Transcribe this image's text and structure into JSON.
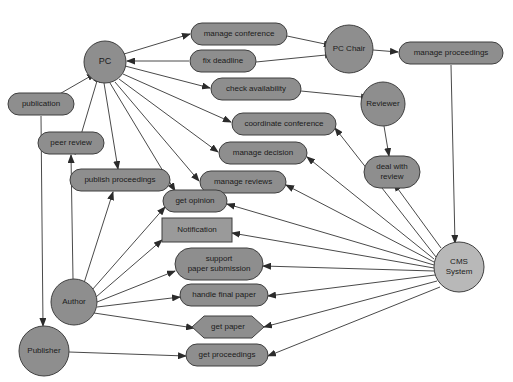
{
  "diagram": {
    "background": "#ffffff",
    "width": 513,
    "height": 382,
    "colors": {
      "actor_fill": "#8e8e8e",
      "usecase_fill": "#8e8e8e",
      "system_fill": "#b8b8b8",
      "rect_fill": "#9a9a9a",
      "hexagon_fill": "#8e8e8e",
      "stroke": "#3f3f3f",
      "edge": "#4a4a4a",
      "text": "#1b1b1b"
    },
    "nodes": [
      {
        "id": "pc",
        "label": "PC",
        "lines": [
          "PC"
        ],
        "shape": "circle",
        "cx": 105,
        "cy": 62,
        "rx": 21,
        "ry": 21,
        "fill": "#8e8e8e",
        "font_size": 9
      },
      {
        "id": "publication",
        "label": "publication",
        "lines": [
          "publication"
        ],
        "shape": "rounded",
        "cx": 41,
        "cy": 104,
        "rx": 33,
        "ry": 11,
        "fill": "#8e8e8e",
        "font_size": 8
      },
      {
        "id": "peer_review",
        "label": "peer review",
        "lines": [
          "peer review"
        ],
        "shape": "rounded",
        "cx": 71,
        "cy": 143,
        "rx": 33,
        "ry": 11,
        "fill": "#8e8e8e",
        "font_size": 8
      },
      {
        "id": "publish_proceedings",
        "label": "publish proceedings",
        "lines": [
          "publish proceedings"
        ],
        "shape": "rounded",
        "cx": 120,
        "cy": 180,
        "rx": 50,
        "ry": 11,
        "fill": "#8e8e8e",
        "font_size": 8
      },
      {
        "id": "manage_conference",
        "label": "manage conference",
        "lines": [
          "manage conference"
        ],
        "shape": "rounded",
        "cx": 239,
        "cy": 34,
        "rx": 48,
        "ry": 11,
        "fill": "#8e8e8e",
        "font_size": 8
      },
      {
        "id": "fix_deadline",
        "label": "fix deadline",
        "lines": [
          "fix deadline"
        ],
        "shape": "rounded",
        "cx": 223,
        "cy": 61,
        "rx": 33,
        "ry": 11,
        "fill": "#8e8e8e",
        "font_size": 8
      },
      {
        "id": "check_availability",
        "label": "check availability",
        "lines": [
          "check availability"
        ],
        "shape": "rounded",
        "cx": 256,
        "cy": 89,
        "rx": 45,
        "ry": 11,
        "fill": "#8e8e8e",
        "font_size": 8
      },
      {
        "id": "coordinate_conference",
        "label": "coordinate conference",
        "lines": [
          "coordinate conference"
        ],
        "shape": "rounded",
        "cx": 284,
        "cy": 124,
        "rx": 52,
        "ry": 11,
        "fill": "#8e8e8e",
        "font_size": 8
      },
      {
        "id": "manage_decision",
        "label": "manage decision",
        "lines": [
          "manage decision"
        ],
        "shape": "rounded",
        "cx": 263,
        "cy": 153,
        "rx": 44,
        "ry": 11,
        "fill": "#8e8e8e",
        "font_size": 8
      },
      {
        "id": "manage_reviews",
        "label": "manage reviews",
        "lines": [
          "manage reviews"
        ],
        "shape": "rounded",
        "cx": 243,
        "cy": 182,
        "rx": 43,
        "ry": 11,
        "fill": "#8e8e8e",
        "font_size": 8
      },
      {
        "id": "get_opinion",
        "label": "get opinion",
        "lines": [
          "get opinion"
        ],
        "shape": "rounded",
        "cx": 195,
        "cy": 201,
        "rx": 32,
        "ry": 11,
        "fill": "#8e8e8e",
        "font_size": 8
      },
      {
        "id": "notification",
        "label": "Notification",
        "lines": [
          "Notification"
        ],
        "shape": "rect",
        "cx": 197,
        "cy": 230,
        "rx": 35,
        "ry": 12,
        "fill": "#9a9a9a",
        "font_size": 8
      },
      {
        "id": "support_paper_submission",
        "label": "support paper submission",
        "lines": [
          "support",
          "paper submission"
        ],
        "shape": "rounded",
        "cx": 219,
        "cy": 264,
        "rx": 44,
        "ry": 16,
        "fill": "#8e8e8e",
        "font_size": 8
      },
      {
        "id": "handle_final_paper",
        "label": "handle final paper",
        "lines": [
          "handle final paper"
        ],
        "shape": "rounded",
        "cx": 224,
        "cy": 295,
        "rx": 44,
        "ry": 11,
        "fill": "#8e8e8e",
        "font_size": 8
      },
      {
        "id": "get_paper",
        "label": "get paper",
        "lines": [
          "get paper"
        ],
        "shape": "hexagon",
        "cx": 228,
        "cy": 327,
        "rx": 36,
        "ry": 11,
        "fill": "#8e8e8e",
        "font_size": 8
      },
      {
        "id": "get_proceedings",
        "label": "get proceedings",
        "lines": [
          "get proceedings"
        ],
        "shape": "rounded",
        "cx": 227,
        "cy": 355,
        "rx": 41,
        "ry": 11,
        "fill": "#8e8e8e",
        "font_size": 8
      },
      {
        "id": "pc_chair",
        "label": "PC Chair",
        "lines": [
          "PC Chair"
        ],
        "shape": "circle",
        "cx": 349,
        "cy": 49,
        "rx": 24,
        "ry": 24,
        "fill": "#8e8e8e",
        "font_size": 8
      },
      {
        "id": "manage_proceedings",
        "label": "manage proceedings",
        "lines": [
          "manage proceedings"
        ],
        "shape": "rounded",
        "cx": 451,
        "cy": 53,
        "rx": 52,
        "ry": 11,
        "fill": "#8e8e8e",
        "font_size": 8
      },
      {
        "id": "reviewer",
        "label": "Reviewer",
        "lines": [
          "Reviewer"
        ],
        "shape": "circle",
        "cx": 383,
        "cy": 104,
        "rx": 22,
        "ry": 22,
        "fill": "#8e8e8e",
        "font_size": 8
      },
      {
        "id": "deal_with_review",
        "label": "deal with review",
        "lines": [
          "deal with",
          "review"
        ],
        "shape": "rounded",
        "cx": 392,
        "cy": 172,
        "rx": 28,
        "ry": 16,
        "fill": "#8e8e8e",
        "font_size": 8
      },
      {
        "id": "cms_system",
        "label": "CMS System",
        "lines": [
          "CMS",
          "System"
        ],
        "shape": "circle",
        "cx": 459,
        "cy": 267,
        "rx": 25,
        "ry": 25,
        "fill": "#b8b8b8",
        "font_size": 8
      },
      {
        "id": "author",
        "label": "Author",
        "lines": [
          "Author"
        ],
        "shape": "circle",
        "cx": 74,
        "cy": 302,
        "rx": 23,
        "ry": 23,
        "fill": "#8e8e8e",
        "font_size": 8
      },
      {
        "id": "publisher",
        "label": "Publisher",
        "lines": [
          "Publisher"
        ],
        "shape": "circle",
        "cx": 44,
        "cy": 351,
        "rx": 25,
        "ry": 25,
        "fill": "#8e8e8e",
        "font_size": 8
      }
    ],
    "edges": [
      {
        "from": "pc",
        "to": "manage_conference",
        "x1": 124,
        "y1": 54,
        "x2": 190,
        "y2": 34,
        "arrow": "end"
      },
      {
        "from": "fix_deadline",
        "to": "pc",
        "x1": 189,
        "y1": 61,
        "x2": 127,
        "y2": 61,
        "arrow": "end"
      },
      {
        "from": "pc",
        "to": "check_availability",
        "x1": 125,
        "y1": 66,
        "x2": 210,
        "y2": 88,
        "arrow": "end"
      },
      {
        "from": "pc",
        "to": "coordinate_conference",
        "x1": 123,
        "y1": 74,
        "x2": 231,
        "y2": 122,
        "arrow": "end"
      },
      {
        "from": "pc",
        "to": "manage_decision",
        "x1": 119,
        "y1": 79,
        "x2": 218,
        "y2": 152,
        "arrow": "end"
      },
      {
        "from": "pc",
        "to": "manage_reviews",
        "x1": 115,
        "y1": 82,
        "x2": 199,
        "y2": 181,
        "arrow": "end"
      },
      {
        "from": "pc",
        "to": "get_opinion",
        "x1": 110,
        "y1": 83,
        "x2": 175,
        "y2": 191,
        "arrow": "end"
      },
      {
        "from": "pc",
        "to": "publish_proceedings",
        "x1": 104,
        "y1": 83,
        "x2": 118,
        "y2": 169,
        "arrow": "end"
      },
      {
        "from": "pc",
        "to": "peer_review",
        "x1": 97,
        "y1": 81,
        "x2": 75,
        "y2": 155,
        "arrow": "start"
      },
      {
        "from": "pc",
        "to": "publication",
        "x1": 89,
        "y1": 77,
        "x2": 56,
        "y2": 96,
        "arrow": "start"
      },
      {
        "from": "pc_chair",
        "to": "manage_conference",
        "x1": 325,
        "y1": 44,
        "x2": 287,
        "y2": 36,
        "arrow": "start"
      },
      {
        "from": "pc_chair",
        "to": "fix_deadline",
        "x1": 326,
        "y1": 55,
        "x2": 256,
        "y2": 62,
        "arrow": "start"
      },
      {
        "from": "pc_chair",
        "to": "manage_proceedings",
        "x1": 373,
        "y1": 50,
        "x2": 398,
        "y2": 52,
        "arrow": "end"
      },
      {
        "from": "manage_proceedings",
        "to": "cms_system",
        "x1": 451,
        "y1": 65,
        "x2": 455,
        "y2": 243,
        "arrow": "end"
      },
      {
        "from": "reviewer",
        "to": "check_availability",
        "x1": 362,
        "y1": 97,
        "x2": 301,
        "y2": 91,
        "arrow": "start"
      },
      {
        "from": "reviewer",
        "to": "deal_with_review",
        "x1": 384,
        "y1": 126,
        "x2": 389,
        "y2": 156,
        "arrow": "end"
      },
      {
        "from": "deal_with_review",
        "to": "cms_system",
        "x1": 398,
        "y1": 189,
        "x2": 441,
        "y2": 248,
        "arrow": "start"
      },
      {
        "from": "cms_system",
        "to": "coordinate_conference",
        "x1": 436,
        "y1": 257,
        "x2": 335,
        "y2": 128,
        "arrow": "end"
      },
      {
        "from": "cms_system",
        "to": "manage_decision",
        "x1": 434,
        "y1": 259,
        "x2": 307,
        "y2": 157,
        "arrow": "end"
      },
      {
        "from": "cms_system",
        "to": "manage_reviews",
        "x1": 434,
        "y1": 262,
        "x2": 286,
        "y2": 185,
        "arrow": "end"
      },
      {
        "from": "cms_system",
        "to": "get_opinion",
        "x1": 434,
        "y1": 265,
        "x2": 227,
        "y2": 204,
        "arrow": "end"
      },
      {
        "from": "cms_system",
        "to": "notification",
        "x1": 434,
        "y1": 268,
        "x2": 232,
        "y2": 233,
        "arrow": "end"
      },
      {
        "from": "cms_system",
        "to": "support_paper_submission",
        "x1": 434,
        "y1": 271,
        "x2": 263,
        "y2": 266,
        "arrow": "end"
      },
      {
        "from": "cms_system",
        "to": "handle_final_paper",
        "x1": 435,
        "y1": 275,
        "x2": 268,
        "y2": 296,
        "arrow": "end"
      },
      {
        "from": "cms_system",
        "to": "get_paper",
        "x1": 437,
        "y1": 281,
        "x2": 264,
        "y2": 327,
        "arrow": "end"
      },
      {
        "from": "cms_system",
        "to": "get_proceedings",
        "x1": 440,
        "y1": 287,
        "x2": 268,
        "y2": 356,
        "arrow": "end"
      },
      {
        "from": "author",
        "to": "peer_review",
        "x1": 73,
        "y1": 279,
        "x2": 71,
        "y2": 155,
        "arrow": "end"
      },
      {
        "from": "author",
        "to": "publish_proceedings",
        "x1": 84,
        "y1": 283,
        "x2": 113,
        "y2": 192,
        "arrow": "end"
      },
      {
        "from": "author",
        "to": "get_opinion",
        "x1": 92,
        "y1": 290,
        "x2": 165,
        "y2": 207,
        "arrow": "end"
      },
      {
        "from": "author",
        "to": "notification",
        "x1": 96,
        "y1": 297,
        "x2": 162,
        "y2": 240,
        "arrow": "end"
      },
      {
        "from": "author",
        "to": "support_paper_submission",
        "x1": 97,
        "y1": 302,
        "x2": 175,
        "y2": 271,
        "arrow": "end"
      },
      {
        "from": "author",
        "to": "handle_final_paper",
        "x1": 97,
        "y1": 307,
        "x2": 180,
        "y2": 297,
        "arrow": "end"
      },
      {
        "from": "author",
        "to": "get_paper",
        "x1": 94,
        "y1": 313,
        "x2": 194,
        "y2": 328,
        "arrow": "end"
      },
      {
        "from": "publication",
        "to": "publisher",
        "x1": 41,
        "y1": 116,
        "x2": 43,
        "y2": 326,
        "arrow": "end"
      },
      {
        "from": "publisher",
        "to": "get_proceedings",
        "x1": 69,
        "y1": 352,
        "x2": 186,
        "y2": 356,
        "arrow": "end"
      }
    ]
  }
}
